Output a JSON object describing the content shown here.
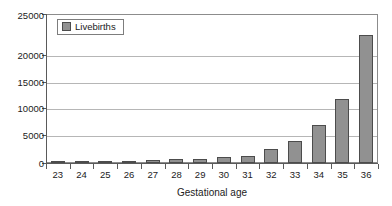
{
  "chart_data": {
    "type": "bar",
    "title": "",
    "subtitle": "",
    "xlabel": "Gestational age",
    "ylabel": "",
    "categories": [
      "23",
      "24",
      "25",
      "26",
      "27",
      "28",
      "29",
      "30",
      "31",
      "32",
      "33",
      "34",
      "35",
      "36"
    ],
    "series": [
      {
        "name": "Livebirths",
        "values": [
          200,
          250,
          300,
          350,
          450,
          650,
          750,
          950,
          1250,
          2300,
          3700,
          6400,
          10700,
          21500
        ],
        "color": "#919191"
      }
    ],
    "ylim": [
      0,
      25000
    ],
    "yticks": [
      0,
      5000,
      10000,
      15000,
      20000,
      25000
    ],
    "ytick_labels": [
      "0",
      "5000",
      "10000",
      "15000",
      "20000",
      "25000"
    ],
    "grid": true,
    "grid_axis": "y",
    "legend": [
      "Livebirths"
    ],
    "legend_position": "top-left-inside"
  },
  "legend": {
    "swatch_name": "livebirths-swatch",
    "label": "Livebirths"
  },
  "axes": {
    "x_title": "Gestational age"
  },
  "colors": {
    "bar_fill": "#919191",
    "bar_stroke": "#4c4c4c",
    "gridline": "#b6b6b6",
    "axis": "#5a5a5a",
    "plot_border": "#8c8c8c",
    "text": "#1b1b1b",
    "background": "#ffffff"
  }
}
